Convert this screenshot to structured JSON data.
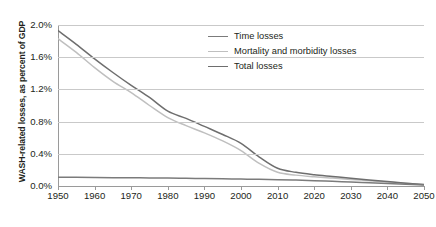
{
  "chart_data": {
    "type": "line",
    "title": "",
    "xlabel": "",
    "ylabel": "WASH-related losses, as percent of GDP",
    "xlim": [
      1950,
      2050
    ],
    "ylim": [
      0.0,
      2.0
    ],
    "grid": true,
    "legend_position": "top-right-inside",
    "xticks": [
      "1950",
      "1960",
      "1970",
      "1980",
      "1990",
      "2000",
      "2010",
      "2020",
      "2030",
      "2040",
      "2050"
    ],
    "xtick_values": [
      1950,
      1960,
      1970,
      1980,
      1990,
      2000,
      2010,
      2020,
      2030,
      2040,
      2050
    ],
    "yticks": [
      "0.0%",
      "0.4%",
      "0.8%",
      "1.2%",
      "1.6%",
      "2.0%"
    ],
    "ytick_values": [
      0.0,
      0.4,
      0.8,
      1.2,
      1.6,
      2.0
    ],
    "x": [
      1950,
      1955,
      1960,
      1965,
      1970,
      1975,
      1980,
      1985,
      1990,
      1995,
      2000,
      2005,
      2010,
      2015,
      2020,
      2025,
      2030,
      2035,
      2040,
      2045,
      2050
    ],
    "series": [
      {
        "name": "Time losses",
        "color": "#7b7b7b",
        "values": [
          0.11,
          0.108,
          0.106,
          0.104,
          0.102,
          0.1,
          0.098,
          0.095,
          0.092,
          0.089,
          0.086,
          0.083,
          0.079,
          0.073,
          0.066,
          0.058,
          0.05,
          0.041,
          0.032,
          0.022,
          0.012
        ]
      },
      {
        "name": "Mortality and morbidity losses",
        "color": "#bfbfbf",
        "values": [
          1.83,
          1.66,
          1.47,
          1.3,
          1.16,
          1.0,
          0.85,
          0.75,
          0.66,
          0.56,
          0.44,
          0.28,
          0.17,
          0.135,
          0.115,
          0.098,
          0.082,
          0.066,
          0.05,
          0.033,
          0.016
        ]
      },
      {
        "name": "Total losses",
        "color": "#6e6e6e",
        "values": [
          1.93,
          1.76,
          1.58,
          1.41,
          1.25,
          1.1,
          0.93,
          0.84,
          0.74,
          0.64,
          0.53,
          0.36,
          0.22,
          0.17,
          0.14,
          0.118,
          0.096,
          0.075,
          0.055,
          0.035,
          0.018
        ]
      }
    ]
  },
  "legend": {
    "items": [
      {
        "label": "Time losses",
        "color": "#7b7b7b"
      },
      {
        "label": "Mortality and morbidity losses",
        "color": "#bfbfbf"
      },
      {
        "label": "Total losses",
        "color": "#6e6e6e"
      }
    ]
  },
  "axes": {
    "y_title": "WASH-related losses, as percent of GDP"
  }
}
